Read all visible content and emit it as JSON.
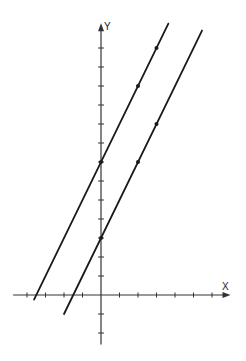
{
  "chart_data": {
    "type": "line",
    "title": "",
    "xlabel": "X",
    "ylabel": "Y",
    "xlim": [
      -4.75,
      7
    ],
    "ylim": [
      -2.6,
      14.3
    ],
    "grid": false,
    "legend": null,
    "x_ticks": [
      -4,
      -3,
      -2,
      -1,
      1,
      2,
      3,
      4,
      5,
      6
    ],
    "y_ticks": [
      -2,
      -1,
      1,
      2,
      3,
      4,
      5,
      6,
      7,
      8,
      9,
      10,
      11,
      12,
      13
    ],
    "tick_labels_shown": false,
    "series": [
      {
        "name": "y = 2x + 7",
        "slope": 2,
        "intercept": 7,
        "x_range": [
          -3.62,
          3.64
        ],
        "marked_points": [
          [
            0,
            7
          ],
          [
            2,
            11
          ],
          [
            3,
            13
          ]
        ]
      },
      {
        "name": "y = 2x + 3",
        "slope": 2,
        "intercept": 3,
        "x_range": [
          -2.0,
          5.46
        ],
        "marked_points": [
          [
            0,
            3
          ],
          [
            2,
            7
          ],
          [
            3,
            9
          ]
        ]
      }
    ]
  },
  "labels": {
    "x_axis": "X",
    "y_axis": "Y"
  },
  "layout": {
    "origin_px": [
      101,
      295
    ],
    "unit_x_px": 18.5,
    "unit_y_px": 19,
    "line_color": "#1a1a1a",
    "axis_color": "#333333"
  }
}
